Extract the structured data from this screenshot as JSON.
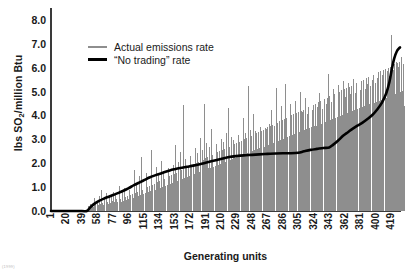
{
  "chart_data": {
    "type": "bar",
    "title": "",
    "xlabel": "Generating units",
    "ylabel": "lbs SO2/million Btu",
    "ylabel_parts": {
      "prefix": "lbs SO",
      "sub": "2",
      "suffix": "/million Btu"
    },
    "ylim": [
      0.0,
      8.5
    ],
    "yticks": [
      0.0,
      1.0,
      2.0,
      3.0,
      4.0,
      5.0,
      6.0,
      7.0,
      8.0
    ],
    "ytick_labels": [
      "0.0",
      "1.0",
      "2.0",
      "3.0",
      "4.0",
      "5.0",
      "6.0",
      "7.0",
      "8.0"
    ],
    "xlim": [
      1,
      430
    ],
    "xticks": [
      1,
      20,
      39,
      58,
      77,
      96,
      115,
      134,
      153,
      172,
      191,
      210,
      229,
      248,
      267,
      286,
      305,
      324,
      343,
      362,
      381,
      400,
      419
    ],
    "xtick_labels": [
      "1",
      "20",
      "39",
      "58",
      "77",
      "96",
      "115",
      "134",
      "153",
      "172",
      "191",
      "210",
      "229",
      "248",
      "267",
      "286",
      "305",
      "324",
      "343",
      "362",
      "381",
      "400",
      "419"
    ],
    "grid": false,
    "legend_position": "upper-left-inside",
    "series": [
      {
        "name": "Actual emissions rate",
        "type": "bar",
        "color": "#8e8e8e",
        "x_start": 1,
        "values": [
          0,
          0,
          0,
          0,
          0,
          0,
          0,
          0,
          0,
          0,
          0,
          0,
          0,
          0,
          0,
          0,
          0,
          0,
          0,
          0,
          0,
          0,
          0,
          0,
          0,
          0,
          0,
          0,
          0,
          0,
          0,
          0,
          0,
          0,
          0,
          0,
          0,
          0,
          0,
          0,
          0,
          0,
          0,
          0,
          0.05,
          0.12,
          0.22,
          0.1,
          0.31,
          0.18,
          0.42,
          0.24,
          0.15,
          0.55,
          0.28,
          0.2,
          0.47,
          0.33,
          0.26,
          0.62,
          0.3,
          0.23,
          0.88,
          0.35,
          0.27,
          0.52,
          0.4,
          0.31,
          0.75,
          0.36,
          0.29,
          0.58,
          0.44,
          0.34,
          0.66,
          0.41,
          0.8,
          0.46,
          0.36,
          0.7,
          0.52,
          0.39,
          0.61,
          0.45,
          1.05,
          0.5,
          0.38,
          0.82,
          0.55,
          0.43,
          0.95,
          0.58,
          0.46,
          1.22,
          0.62,
          0.49,
          0.88,
          0.66,
          0.52,
          1.35,
          0.7,
          0.55,
          1.72,
          0.74,
          0.58,
          1.15,
          0.8,
          0.62,
          1.48,
          0.85,
          0.66,
          2.25,
          0.9,
          0.7,
          1.28,
          0.95,
          0.74,
          1.6,
          1.0,
          0.78,
          1.42,
          1.05,
          0.82,
          2.55,
          1.1,
          0.86,
          1.35,
          1.15,
          0.9,
          1.85,
          1.2,
          0.94,
          1.52,
          1.25,
          0.98,
          2.1,
          1.3,
          1.02,
          1.68,
          1.35,
          1.06,
          2.4,
          1.4,
          1.1,
          1.78,
          1.45,
          1.14,
          4.75,
          1.5,
          1.18,
          1.92,
          1.55,
          1.22,
          2.75,
          1.6,
          1.26,
          2.05,
          1.65,
          1.3,
          2.48,
          1.7,
          1.34,
          4.45,
          1.75,
          1.38,
          2.18,
          1.8,
          1.42,
          2.95,
          1.85,
          1.46,
          2.3,
          1.9,
          1.5,
          4.55,
          1.95,
          1.54,
          2.62,
          2.0,
          1.58,
          2.42,
          2.05,
          1.62,
          3.05,
          2.1,
          1.66,
          2.55,
          2.15,
          4.5,
          2.2,
          1.74,
          2.85,
          2.25,
          1.78,
          2.7,
          2.3,
          1.82,
          3.45,
          2.35,
          1.86,
          2.95,
          2.4,
          1.9,
          2.8,
          2.45,
          1.94,
          3.6,
          2.5,
          1.98,
          3.02,
          2.55,
          2.02,
          2.9,
          2.6,
          2.06,
          3.25,
          2.65,
          2.1,
          4.3,
          2.7,
          2.14,
          3.1,
          2.75,
          2.18,
          2.98,
          2.8,
          2.22,
          3.72,
          2.85,
          2.26,
          3.18,
          2.9,
          2.3,
          3.05,
          2.95,
          2.34,
          3.88,
          3.0,
          2.38,
          3.28,
          3.05,
          2.42,
          5.25,
          3.1,
          2.46,
          3.4,
          3.15,
          2.5,
          4.05,
          3.2,
          2.54,
          3.35,
          3.25,
          2.58,
          5.55,
          3.3,
          2.62,
          3.52,
          3.35,
          2.66,
          4.12,
          3.4,
          2.7,
          3.48,
          3.45,
          5.82,
          3.5,
          2.78,
          3.65,
          3.55,
          2.82,
          4.25,
          3.6,
          2.86,
          3.58,
          3.65,
          2.9,
          5.15,
          3.7,
          2.94,
          3.78,
          3.75,
          2.98,
          4.38,
          3.8,
          3.02,
          3.7,
          3.85,
          5.32,
          3.9,
          3.1,
          3.92,
          3.95,
          3.14,
          4.5,
          4.0,
          3.18,
          3.85,
          4.05,
          3.22,
          4.62,
          4.1,
          3.26,
          4.02,
          4.15,
          3.3,
          5.0,
          4.2,
          3.34,
          4.15,
          4.25,
          3.38,
          4.72,
          4.3,
          3.42,
          4.08,
          4.35,
          3.46,
          4.85,
          4.4,
          3.5,
          4.22,
          4.45,
          3.54,
          5.68,
          4.5,
          3.58,
          4.35,
          4.55,
          3.62,
          4.95,
          4.6,
          3.66,
          4.28,
          4.65,
          6.95,
          4.7,
          3.74,
          4.48,
          4.75,
          3.78,
          5.75,
          4.8,
          3.82,
          4.55,
          4.85,
          3.86,
          5.1,
          4.9,
          3.9,
          4.42,
          4.95,
          3.94,
          5.28,
          5.0,
          3.98,
          4.65,
          5.05,
          4.02,
          5.45,
          5.1,
          4.06,
          4.78,
          5.15,
          4.1,
          5.38,
          5.2,
          4.14,
          4.88,
          5.25,
          4.18,
          5.52,
          5.3,
          4.22,
          4.95,
          5.35,
          4.26,
          5.18,
          5.4,
          4.3,
          5.05,
          5.45,
          4.34,
          5.62,
          5.5,
          4.38,
          5.12,
          5.55,
          4.42,
          5.3,
          5.6,
          4.46,
          5.22,
          5.65,
          4.5,
          5.48,
          5.7,
          4.54,
          5.35,
          5.75,
          4.58,
          5.58,
          5.8,
          4.62,
          5.42,
          5.85,
          4.66,
          5.7,
          5.9,
          4.7,
          5.55,
          5.95,
          4.74,
          5.85,
          6.0,
          4.78,
          5.65,
          6.05,
          7.35,
          6.1,
          4.86,
          5.92,
          6.15,
          4.9,
          6.25,
          6.2,
          4.94,
          6.05,
          6.25,
          4.98,
          6.45,
          6.3,
          5.02,
          6.15,
          4.4
        ]
      },
      {
        "name": "“No trading” rate",
        "type": "line",
        "color": "#000000",
        "description": "Smooth monotonically increasing reference curve",
        "points": [
          [
            1,
            0.0
          ],
          [
            20,
            0.0
          ],
          [
            39,
            0.0
          ],
          [
            45,
            0.0
          ],
          [
            50,
            0.18
          ],
          [
            55,
            0.32
          ],
          [
            60,
            0.42
          ],
          [
            66,
            0.52
          ],
          [
            72,
            0.6
          ],
          [
            78,
            0.68
          ],
          [
            84,
            0.76
          ],
          [
            90,
            0.85
          ],
          [
            96,
            0.95
          ],
          [
            103,
            1.08
          ],
          [
            110,
            1.2
          ],
          [
            116,
            1.3
          ],
          [
            122,
            1.4
          ],
          [
            128,
            1.48
          ],
          [
            134,
            1.55
          ],
          [
            140,
            1.62
          ],
          [
            147,
            1.7
          ],
          [
            153,
            1.75
          ],
          [
            160,
            1.8
          ],
          [
            168,
            1.85
          ],
          [
            176,
            1.9
          ],
          [
            184,
            1.96
          ],
          [
            191,
            2.02
          ],
          [
            198,
            2.08
          ],
          [
            205,
            2.14
          ],
          [
            212,
            2.2
          ],
          [
            220,
            2.26
          ],
          [
            229,
            2.3
          ],
          [
            238,
            2.33
          ],
          [
            248,
            2.35
          ],
          [
            257,
            2.37
          ],
          [
            267,
            2.39
          ],
          [
            277,
            2.41
          ],
          [
            286,
            2.42
          ],
          [
            296,
            2.42
          ],
          [
            305,
            2.44
          ],
          [
            312,
            2.5
          ],
          [
            320,
            2.56
          ],
          [
            328,
            2.6
          ],
          [
            336,
            2.64
          ],
          [
            343,
            2.66
          ],
          [
            348,
            2.78
          ],
          [
            354,
            2.95
          ],
          [
            360,
            3.15
          ],
          [
            366,
            3.3
          ],
          [
            372,
            3.45
          ],
          [
            378,
            3.58
          ],
          [
            384,
            3.7
          ],
          [
            390,
            3.85
          ],
          [
            396,
            4.02
          ],
          [
            402,
            4.25
          ],
          [
            408,
            4.55
          ],
          [
            413,
            4.92
          ],
          [
            417,
            5.4
          ],
          [
            420,
            5.95
          ],
          [
            423,
            6.4
          ],
          [
            426,
            6.68
          ],
          [
            429,
            6.82
          ],
          [
            430,
            6.85
          ]
        ]
      }
    ]
  },
  "legend": {
    "items": [
      {
        "label": "Actual emissions rate",
        "color": "#8e8e8e",
        "style": "thin"
      },
      {
        "label": "“No trading” rate",
        "color": "#000000",
        "style": "thick"
      }
    ]
  },
  "footnote": "(1999)"
}
